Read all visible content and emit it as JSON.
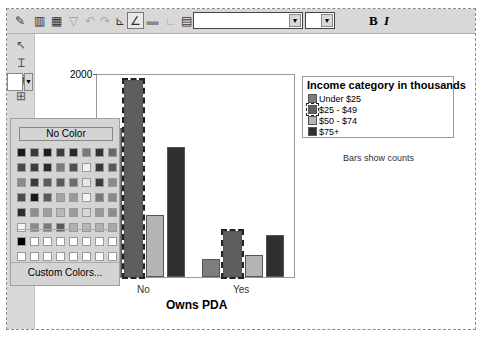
{
  "toolbar": {
    "buttons": [
      {
        "name": "chart-properties-icon",
        "glyph": "✎"
      },
      {
        "name": "bar-chart-icon",
        "glyph": "▥"
      },
      {
        "name": "chart-gallery-icon",
        "glyph": "▦"
      },
      {
        "name": "funnel-icon",
        "glyph": "▽"
      },
      {
        "name": "undo-icon",
        "glyph": "↶"
      },
      {
        "name": "redo-icon",
        "glyph": "↷"
      },
      {
        "name": "axis-icon",
        "glyph": "⊾"
      },
      {
        "name": "axis-line-icon",
        "glyph": "∠"
      },
      {
        "name": "grid-icon",
        "glyph": "▬"
      },
      {
        "name": "frame-icon",
        "glyph": "∟"
      },
      {
        "name": "legend-icon",
        "glyph": "▤"
      }
    ],
    "font_name": "",
    "font_size": "",
    "bold_label": "B",
    "italic_label": "I"
  },
  "left_tools": {
    "buttons": [
      {
        "name": "pointer-icon",
        "glyph": "↖"
      },
      {
        "name": "text-cursor-icon",
        "glyph": "Ɪ"
      },
      {
        "name": "text-box-icon",
        "glyph": "▣"
      },
      {
        "name": "frame-tool-icon",
        "glyph": "⊞"
      }
    ]
  },
  "palette": {
    "no_color_label": "No Color",
    "custom_colors_label": "Custom Colors...",
    "rows": [
      [
        "#1a1a1a",
        "#3a3a3a",
        "#1e1e1e",
        "#3d3d3d",
        "#2a2a2a",
        "#7a7a7a",
        "#333333",
        "#6a6a6a"
      ],
      [
        "#4a4a4a",
        "#3c3c3c",
        "#2a2a2a",
        "#7c7c7c",
        "#4e4e4e",
        "#f0f0f0",
        "#3a3a3a",
        "#585858"
      ],
      [
        "#8a8a8a",
        "#3a3a3a",
        "#5c5c5c",
        "#5a5a5a",
        "#6c6c6c",
        "#e8e8e8",
        "#3c3c3c",
        "#8a8a8a"
      ],
      [
        "#4c4c4c",
        "#1a1a1a",
        "#5a5a5a",
        "#a6a6a6",
        "#9a9a9a",
        "#f4f4f4",
        "#7a7a7a",
        "#8a8a8a"
      ],
      [
        "#2e2e2e",
        "#8e8e8e",
        "#a0a0a0",
        "#b8b8b8",
        "#9c9c9c",
        "#d8d8d8",
        "#9a9a9a",
        "#8c8c8c"
      ],
      [
        "#f4f4f4",
        "#8a8a8a",
        "#7a7a7a",
        "#5a5a5a",
        "#b0b0b0",
        "#b6b6b6",
        "#b0b0b0",
        "#a8a8a8"
      ]
    ],
    "custom_rows": [
      [
        "#000000",
        "#ffffff",
        "#ffffff",
        "#ffffff",
        "#ffffff",
        "#ffffff",
        "#ffffff",
        "#ffffff"
      ],
      [
        "#ffffff",
        "#ffffff",
        "#ffffff",
        "#ffffff",
        "#ffffff",
        "#ffffff",
        "#ffffff",
        "#ffffff"
      ]
    ]
  },
  "chart_data": {
    "type": "bar",
    "title": "",
    "xlabel": "Owns PDA",
    "ylabel": "",
    "categories": [
      "No",
      "Yes"
    ],
    "series": [
      {
        "name": "Under $25",
        "color": "#7d7d7d",
        "values": [
          740,
          175
        ]
      },
      {
        "name": "$25 - $49",
        "color": "#5e5e5e",
        "values": [
          2000,
          440
        ]
      },
      {
        "name": "$50 - $74",
        "color": "#b4b4b4",
        "values": [
          1110,
          230
        ]
      },
      {
        "name": "$75+",
        "color": "#303030",
        "values": [
          1560,
          405
        ]
      }
    ],
    "selected_series": "$25 - $49",
    "yticks": [
      "2000"
    ],
    "ylim": [
      0,
      2000
    ],
    "legend_title": "Income category in thousands",
    "legend_position": "right",
    "annotation": "Bars show counts",
    "grid": false
  }
}
